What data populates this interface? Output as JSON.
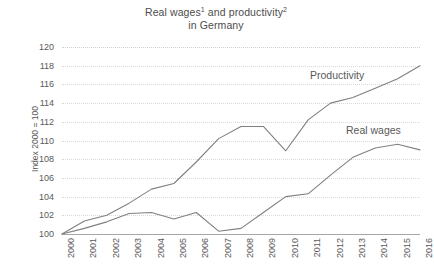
{
  "chart": {
    "title_line1_pre": "Real wages",
    "title_line1_sup1": "1",
    "title_line1_mid": " and productivity",
    "title_line1_sup2": "2",
    "title_line2": "in Germany",
    "ylabel": "Index 2000 = 100",
    "annotation_productivity": "Productivity",
    "annotation_realwages": "Real wages",
    "line_color": "#808080",
    "axis_color": "#a6a6a6",
    "grid_color": "#d9d9d9",
    "text_color": "#595959"
  },
  "chart_data": {
    "type": "line",
    "xlabel": "",
    "ylabel": "Index 2000 = 100",
    "ylim": [
      100,
      120
    ],
    "ytick_step": 2,
    "yticks": [
      100,
      102,
      104,
      106,
      108,
      110,
      112,
      114,
      116,
      118,
      120
    ],
    "grid": true,
    "grid_axis": "y",
    "legend_position": "inline-annotations",
    "x": [
      2000,
      2001,
      2002,
      2003,
      2004,
      2005,
      2006,
      2007,
      2008,
      2009,
      2010,
      2011,
      2012,
      2013,
      2014,
      2015,
      2016
    ],
    "categories": [
      "2000",
      "2001",
      "2002",
      "2003",
      "2004",
      "2005",
      "2006",
      "2007",
      "2008",
      "2009",
      "2010",
      "2011",
      "2012",
      "2013",
      "2014",
      "2015",
      "2016"
    ],
    "series": [
      {
        "name": "Productivity",
        "values": [
          100.0,
          101.4,
          102.0,
          103.3,
          104.8,
          105.4,
          107.7,
          110.2,
          111.5,
          111.5,
          108.9,
          112.2,
          114.0,
          114.6,
          115.6,
          116.6,
          118.0
        ]
      },
      {
        "name": "Real wages",
        "values": [
          100.0,
          100.6,
          101.3,
          102.2,
          102.3,
          101.6,
          102.3,
          100.3,
          100.6,
          102.3,
          104.0,
          104.3,
          106.3,
          108.2,
          109.2,
          109.6,
          109.0
        ]
      }
    ]
  }
}
